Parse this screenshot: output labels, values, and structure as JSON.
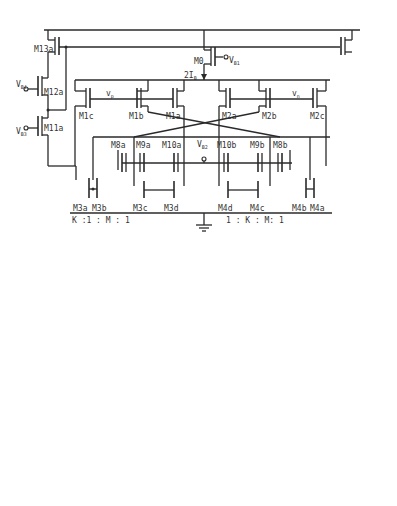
{
  "figure_a": {
    "caption": "(a) DRFC",
    "supply": "VDD",
    "bias_labels": {
      "vb1": "V",
      "vb1_sub": "B1",
      "vb2": "V",
      "vb2_sub": "B2",
      "vb3": "V",
      "vb3_sub": "B3",
      "vb4": "V",
      "vb4_sub": "B4"
    },
    "tail_current": "2I",
    "tail_current_sub": "B",
    "inputs": {
      "vp": "v",
      "vp_sub": "p",
      "vn": "v",
      "vn_sub": "n"
    },
    "output": {
      "label": "v",
      "sub": "out"
    },
    "transistors": [
      "M0",
      "M13a",
      "M13b",
      "M12a",
      "M12b",
      "M11a",
      "M11b",
      "M1a",
      "M1b",
      "M1c",
      "M2a",
      "M2b",
      "M2c",
      "M8a",
      "M9a",
      "M10a",
      "M10b",
      "M9b",
      "M8b",
      "M3a",
      "M3b",
      "M3c",
      "M3d",
      "M4d",
      "M4c",
      "M4b",
      "M4a"
    ],
    "ratio_row": [
      "K",
      ":1",
      ":",
      "M",
      ":",
      "1",
      "1",
      ":",
      "K",
      ":",
      "M:",
      "1"
    ]
  },
  "figure_b": {
    "caption": "(b) Proposed Modified DRC",
    "supply": "VDD",
    "bias_labels": {
      "vb1": "V",
      "vb1_sub": "B1",
      "vb2": "V",
      "vb2_sub": "B2",
      "vcmfb": "V",
      "vcmfb_sub": "CMFB"
    },
    "tail_current": "2I",
    "tail_current_sub": "B",
    "inputs": {
      "vp": "v",
      "vp_sub": "p",
      "vn": "v",
      "vn_sub": "n"
    },
    "outputs": {
      "left": "v",
      "left_sub": "out,n",
      "right": "v",
      "right_sub": "out,"
    },
    "compensation": {
      "cc": "C",
      "cc_sub": "C",
      "rc": "R",
      "rc_sub": "c"
    },
    "nodes": {
      "x": "X",
      "y": "Y",
      "z": "Z",
      "w": "W"
    },
    "transistors": [
      "M0",
      "M7a",
      "M7b",
      "M6a",
      "M6b",
      "M5a",
      "M5b",
      "M1a",
      "M1b",
      "M1c",
      "M2a",
      "M2b",
      "M2c",
      "M8a",
      "M9a",
      "M10a",
      "M10b",
      "M9b",
      "M8b",
      "M3a",
      "M3b",
      "M3c",
      "M3d",
      "M4d",
      "M4c",
      "M4b",
      "M4a"
    ],
    "ratio_row": [
      "K",
      ":",
      "1",
      ":",
      "M",
      ":",
      "1",
      "1",
      ":",
      "M",
      ":",
      "1",
      ":",
      "K"
    ]
  }
}
